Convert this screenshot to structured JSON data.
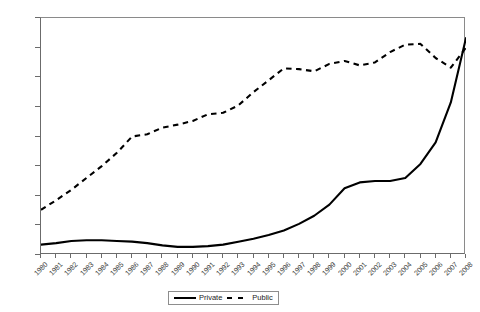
{
  "chart_data": {
    "type": "line",
    "title": "",
    "xlabel": "",
    "ylabel": "",
    "ylim": [
      0,
      1600
    ],
    "ytick_step": 200,
    "yticks": [
      0,
      200,
      400,
      600,
      800,
      1000,
      1200,
      1400,
      1600
    ],
    "ytick_labels": [
      "0",
      "200",
      "400",
      "600",
      "800",
      "1000",
      "1200",
      "1400",
      "1600"
    ],
    "grid": false,
    "legend_position": "bottom-center",
    "x": [
      1980,
      1981,
      1982,
      1983,
      1984,
      1985,
      1986,
      1987,
      1988,
      1989,
      1990,
      1991,
      1992,
      1993,
      1994,
      1995,
      1996,
      1997,
      1998,
      1999,
      2000,
      2001,
      2002,
      2003,
      2004,
      2005,
      2006,
      2007,
      2008
    ],
    "xtick_labels": [
      "1980",
      "1981",
      "1982",
      "1983",
      "1984",
      "1985",
      "1986",
      "1987",
      "1988",
      "1989",
      "1990",
      "1991",
      "1992",
      "1993",
      "1994",
      "1995",
      "1996",
      "1997",
      "1998",
      "1999",
      "2000",
      "2001",
      "2002",
      "2003",
      "2004",
      "2005",
      "2006",
      "2007",
      "2008"
    ],
    "series": [
      {
        "name": "Private",
        "style": "solid",
        "color": "#000000",
        "values": [
          70,
          80,
          95,
          100,
          100,
          95,
          90,
          80,
          65,
          55,
          55,
          60,
          70,
          90,
          110,
          135,
          165,
          210,
          265,
          340,
          450,
          490,
          500,
          500,
          520,
          615,
          760,
          1030,
          1465
        ]
      },
      {
        "name": "Public",
        "style": "dashed",
        "color": "#000000",
        "values": [
          305,
          370,
          440,
          520,
          600,
          690,
          800,
          815,
          860,
          880,
          905,
          950,
          960,
          1010,
          1100,
          1180,
          1260,
          1255,
          1240,
          1290,
          1310,
          1280,
          1300,
          1370,
          1420,
          1425,
          1330,
          1265,
          1400
        ]
      }
    ]
  },
  "legend": {
    "entries": [
      {
        "label": "Private",
        "style": "solid"
      },
      {
        "label": "Public",
        "style": "dashed"
      }
    ]
  }
}
